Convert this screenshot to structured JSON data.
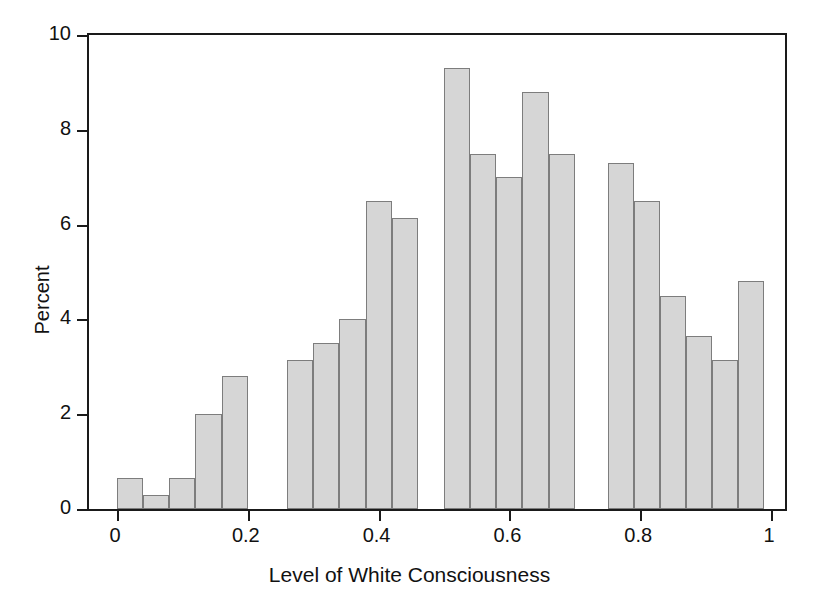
{
  "chart_data": {
    "type": "bar",
    "title": "",
    "xlabel": "Level of White Consciousness",
    "ylabel": "Percent",
    "xlim": [
      0,
      1
    ],
    "ylim": [
      0,
      10
    ],
    "xticks": [
      "0",
      "0.2",
      "0.4",
      "0.6",
      "0.8",
      "1"
    ],
    "xtick_values": [
      0,
      0.2,
      0.4,
      0.6,
      0.8,
      1
    ],
    "yticks": [
      "0",
      "2",
      "4",
      "6",
      "8",
      "10"
    ],
    "ytick_values": [
      0,
      2,
      4,
      6,
      8,
      10
    ],
    "grid": false,
    "legend": null,
    "bin_width": 0.04,
    "bar_fill_color": "#d6d6d6",
    "bar_border_color": "#7d7d7d",
    "axis_color": "#1a1a1a",
    "bins": [
      {
        "x0": 0.0,
        "x1": 0.04,
        "value": 0.65
      },
      {
        "x0": 0.04,
        "x1": 0.08,
        "value": 0.3
      },
      {
        "x0": 0.08,
        "x1": 0.12,
        "value": 0.65
      },
      {
        "x0": 0.12,
        "x1": 0.16,
        "value": 2.0
      },
      {
        "x0": 0.16,
        "x1": 0.2,
        "value": 2.8
      },
      {
        "x0": 0.26,
        "x1": 0.3,
        "value": 3.15
      },
      {
        "x0": 0.3,
        "x1": 0.34,
        "value": 3.5
      },
      {
        "x0": 0.34,
        "x1": 0.38,
        "value": 4.0
      },
      {
        "x0": 0.38,
        "x1": 0.42,
        "value": 6.5
      },
      {
        "x0": 0.42,
        "x1": 0.46,
        "value": 6.15
      },
      {
        "x0": 0.5,
        "x1": 0.54,
        "value": 9.3
      },
      {
        "x0": 0.54,
        "x1": 0.58,
        "value": 7.5
      },
      {
        "x0": 0.58,
        "x1": 0.62,
        "value": 7.0
      },
      {
        "x0": 0.62,
        "x1": 0.66,
        "value": 8.8
      },
      {
        "x0": 0.66,
        "x1": 0.7,
        "value": 7.5
      },
      {
        "x0": 0.75,
        "x1": 0.79,
        "value": 7.3
      },
      {
        "x0": 0.79,
        "x1": 0.83,
        "value": 6.5
      },
      {
        "x0": 0.83,
        "x1": 0.87,
        "value": 4.5
      },
      {
        "x0": 0.87,
        "x1": 0.91,
        "value": 3.65
      },
      {
        "x0": 0.91,
        "x1": 0.95,
        "value": 3.15
      },
      {
        "x0": 0.95,
        "x1": 0.99,
        "value": 4.8
      }
    ]
  }
}
